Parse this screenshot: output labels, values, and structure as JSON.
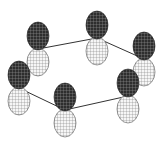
{
  "diagram": {
    "colors": {
      "background": "#ffffff",
      "top_lobe_fill": "#3a3a3a",
      "top_lobe_grid": "#bbbbbb",
      "bottom_lobe_fill": "#f4f4f4",
      "bottom_lobe_grid": "#666666",
      "bond": "#333333"
    },
    "atoms": [
      {
        "id": "top-left",
        "x": 38,
        "y": 49
      },
      {
        "id": "top-center",
        "x": 97,
        "y": 38
      },
      {
        "id": "right",
        "x": 144,
        "y": 59
      },
      {
        "id": "bottom-right",
        "x": 128,
        "y": 96
      },
      {
        "id": "bottom-center",
        "x": 65,
        "y": 110
      },
      {
        "id": "left",
        "x": 19,
        "y": 88
      }
    ]
  }
}
